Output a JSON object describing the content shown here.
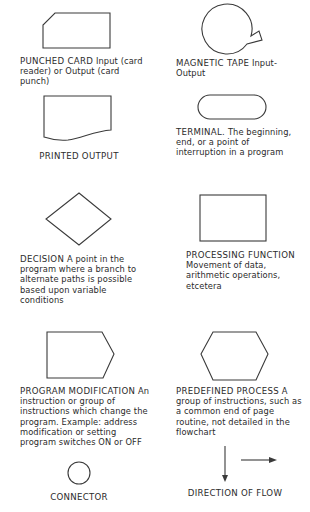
{
  "symbols": [
    {
      "id": "punched-card",
      "title": "PUNCHED CARD",
      "description": "Input (card reader) or Output (card punch)"
    },
    {
      "id": "magnetic-tape",
      "title": "MAGNETIC TAPE",
      "description": "Input-Output"
    },
    {
      "id": "printed-output",
      "title": "PRINTED OUTPUT",
      "description": ""
    },
    {
      "id": "terminal",
      "title": "TERMINAL.",
      "description": "The beginning, end, or a point of interruption in a program"
    },
    {
      "id": "decision",
      "title": "DECISION",
      "description": "A point in the program where a branch to alternate paths is possible based upon variable conditions"
    },
    {
      "id": "processing-function",
      "title": "PROCESSING FUNCTION",
      "description": "Movement of data, arithmetic operations, etcetera"
    },
    {
      "id": "program-modification",
      "title": "PROGRAM MODIFICATION",
      "description": "An instruction or group of instructions which change the program. Example: address modification or setting program switches ON or OFF"
    },
    {
      "id": "predefined-process",
      "title": "PREDEFINED PROCESS",
      "description": "A group of instructions, such as a common end of page routine, not detailed in the flowchart"
    },
    {
      "id": "connector",
      "title": "CONNECTOR",
      "description": ""
    },
    {
      "id": "direction-of-flow",
      "title": "DIRECTION OF FLOW",
      "description": ""
    }
  ],
  "colors": {
    "line": "#3a3a3a",
    "text": "#2b2b2b",
    "background": "#ffffff"
  }
}
